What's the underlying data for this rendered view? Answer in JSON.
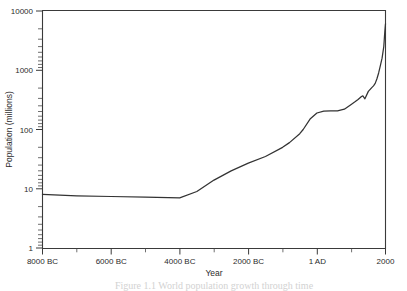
{
  "figure": {
    "background_color": "#ffffff",
    "line_color": "#333333",
    "axis_color": "#3a3a3a",
    "caption": "Figure 1.1  World population growth through time"
  },
  "chart_data": {
    "type": "line",
    "title": "",
    "xlabel": "Year",
    "ylabel": "Population (millions)",
    "yscale": "log",
    "ylim": [
      1,
      10000
    ],
    "xlim": [
      -8000,
      2000
    ],
    "grid": false,
    "legend": false,
    "y_tick_labels": [
      "10000",
      "1000",
      "100",
      "10",
      "1"
    ],
    "y_tick_values": [
      10000,
      1000,
      100,
      10,
      1
    ],
    "x_tick_labels": [
      "8000 BC",
      "6000 BC",
      "4000 BC",
      "2000 BC",
      "1 AD",
      "2000"
    ],
    "x_tick_values": [
      -8000,
      -6000,
      -4000,
      -2000,
      0,
      2000
    ],
    "x_minor_tick_values": [
      -7000,
      -5000,
      -3000,
      -1000,
      1000
    ],
    "series": [
      {
        "name": "World population",
        "x": [
          -8000,
          -7000,
          -6000,
          -5000,
          -4000,
          -3500,
          -3000,
          -2500,
          -2000,
          -1500,
          -1000,
          -800,
          -500,
          -400,
          -200,
          1,
          200,
          400,
          600,
          800,
          1000,
          1100,
          1200,
          1300,
          1340,
          1400,
          1500,
          1600,
          1650,
          1700,
          1750,
          1800,
          1850,
          1900,
          1925,
          1950,
          1960,
          1970,
          1980,
          1990,
          2000
        ],
        "y": [
          8,
          7.6,
          7.4,
          7.2,
          7,
          9,
          14,
          20,
          27,
          35,
          50,
          60,
          85,
          100,
          150,
          190,
          205,
          206,
          206,
          220,
          265,
          290,
          320,
          360,
          370,
          330,
          440,
          510,
          545,
          600,
          720,
          900,
          1200,
          1600,
          2000,
          2520,
          3020,
          3700,
          4440,
          5270,
          6080
        ]
      }
    ],
    "annotations": []
  }
}
